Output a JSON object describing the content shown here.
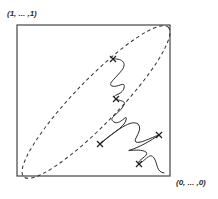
{
  "figure": {
    "corner_labels": {
      "top_left": "(1, ... ,1)",
      "bottom_right": "(0, ... ,0)"
    },
    "box": {
      "x": 17,
      "y": 25,
      "width": 153,
      "height": 151
    },
    "ellipse": {
      "style": "dashed",
      "cx": 96,
      "cy": 102,
      "rx": 104,
      "ry": 22,
      "rotation_deg": -46
    },
    "markers": [
      {
        "symbol": "x",
        "x": 113,
        "y": 59
      },
      {
        "symbol": "x",
        "x": 116,
        "y": 99
      },
      {
        "symbol": "x",
        "x": 100,
        "y": 144
      },
      {
        "symbol": "x",
        "x": 159,
        "y": 135
      },
      {
        "symbol": "x",
        "x": 139,
        "y": 164
      }
    ],
    "colors": {
      "stroke": "#333333",
      "background": "#ffffff"
    }
  }
}
